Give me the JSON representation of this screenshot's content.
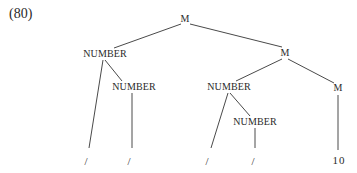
{
  "example_label": "(80)",
  "tree": {
    "nodes": [
      {
        "id": "root",
        "label": "M",
        "x": 185,
        "y": 22
      },
      {
        "id": "n1",
        "label": "NUMBER",
        "x": 105,
        "y": 57
      },
      {
        "id": "n1a",
        "label": "NUMBER",
        "x": 134,
        "y": 90
      },
      {
        "id": "m2",
        "label": "M",
        "x": 285,
        "y": 56
      },
      {
        "id": "n2",
        "label": "NUMBER",
        "x": 229,
        "y": 90
      },
      {
        "id": "n2a",
        "label": "NUMBER",
        "x": 255,
        "y": 125
      },
      {
        "id": "m3",
        "label": "M",
        "x": 338,
        "y": 91
      }
    ],
    "leaves": [
      {
        "id": "l1",
        "label": "/",
        "x": 87
      },
      {
        "id": "l2",
        "label": "/",
        "x": 130
      },
      {
        "id": "l3",
        "label": "/",
        "x": 207
      },
      {
        "id": "l4",
        "label": "/",
        "x": 254
      },
      {
        "id": "l5",
        "label": "10",
        "x": 339
      }
    ]
  }
}
